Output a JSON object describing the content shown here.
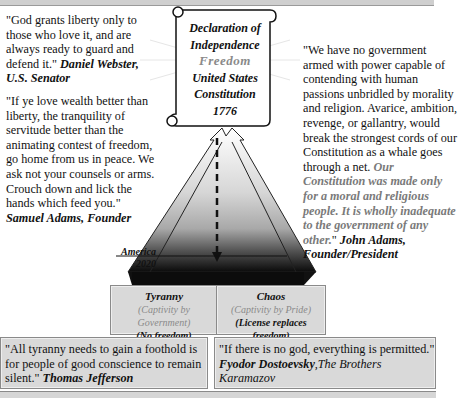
{
  "quotes": {
    "webster": {
      "text": "\"God grants liberty only to those who love it, and are always ready to guard and defend it.\" ",
      "author": "Daniel Webster, U.S. Senator"
    },
    "samuel_adams": {
      "text": "\"If ye love wealth better than liberty, the tranquility of servitude better than the animating contest of freedom, go home from us in peace. We ask not your counsels or arms. Crouch down and lick the hands which feed you.\" ",
      "author": "Samuel Adams, Founder"
    },
    "john_adams": {
      "text": "\"We have no government armed with power capable of contending with human passions unbridled by morality and religion. Avarice, ambition, revenge, or gallantry, would break the strongest cords of our Constitution as a whale goes through a net. ",
      "emphasis": "Our Constitution was made only for a moral and religious people. It is wholly inadequate to the government of any other.",
      "closing": "\" ",
      "author": "John Adams, Founder/President"
    },
    "jefferson": {
      "text": "\"All tyranny needs to gain a foothold is for people of good conscience to remain silent.\" ",
      "author": "Thomas Jefferson"
    },
    "dostoevsky": {
      "text": "\"If there is no god, everything is permitted.\" ",
      "author": "Fyodor Dostoevsky",
      "book": ",The Brothers Karamazov"
    }
  },
  "scroll": {
    "line1": "Declaration of",
    "line2": "Independence",
    "line3": "Freedom",
    "line4": "United States",
    "line5": "Constitution",
    "line6": "1776"
  },
  "timeline": {
    "label": "America",
    "year": "2020"
  },
  "outcomes": {
    "tyranny": {
      "title": "Tyranny",
      "subtitle": "(Captivity by Government)",
      "note": "(No freedom)"
    },
    "chaos": {
      "title": "Chaos",
      "subtitle": "(Captivity by Pride)",
      "note": "(License replaces freedom)"
    }
  },
  "colors": {
    "box_fill": "#d9d9d9",
    "muted_text": "#7a7a7a",
    "pyramid_top": "#ffffff",
    "pyramid_bottom": "#111111"
  }
}
